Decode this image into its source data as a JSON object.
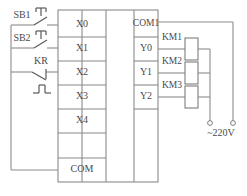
{
  "diagram": {
    "colors": {
      "wire": "#8c8c8c",
      "text": "#4a4a4a",
      "background": "#ffffff"
    },
    "plc": {
      "input_terminals": [
        "X0",
        "X1",
        "X2",
        "X3",
        "X4"
      ],
      "input_common": "COM",
      "output_common": "COM1",
      "output_terminals": [
        "Y0",
        "Y1",
        "Y2"
      ]
    },
    "input_devices": [
      {
        "label": "SB1",
        "type": "pushbutton-no",
        "connects_to": "X0"
      },
      {
        "label": "SB2",
        "type": "pushbutton-no",
        "connects_to": "X1"
      },
      {
        "label": "KR",
        "type": "thermal-overload-nc",
        "connects_to": "X2"
      }
    ],
    "output_devices": [
      {
        "label": "KM1",
        "type": "contactor-coil",
        "connects_to": "Y0"
      },
      {
        "label": "KM2",
        "type": "contactor-coil",
        "connects_to": "Y1"
      },
      {
        "label": "KM3",
        "type": "contactor-coil",
        "connects_to": "Y2"
      }
    ],
    "power_supply": {
      "label": "~220V",
      "terminals": 2
    }
  }
}
